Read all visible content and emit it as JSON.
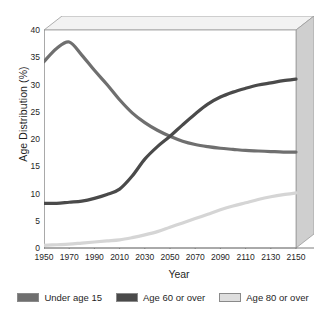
{
  "chart_data": {
    "type": "line",
    "title": "",
    "xlabel": "Year",
    "ylabel": "Age Distribution (%)",
    "xlim": [
      1950,
      2150
    ],
    "ylim": [
      0,
      40
    ],
    "grid": false,
    "legend_position": "bottom",
    "x_ticks": [
      "1950",
      "1970",
      "1990",
      "2010",
      "2030",
      "2050",
      "2070",
      "2090",
      "2110",
      "2130",
      "2150"
    ],
    "y_ticks": [
      "0",
      "5",
      "10",
      "15",
      "20",
      "25",
      "30",
      "35",
      "40"
    ],
    "x": [
      1950,
      1960,
      1970,
      1980,
      1990,
      2000,
      2010,
      2020,
      2030,
      2040,
      2050,
      2060,
      2070,
      2080,
      2090,
      2100,
      2110,
      2120,
      2130,
      2140,
      2150
    ],
    "series": [
      {
        "name": "Under age 15",
        "color": "#6f6f6f",
        "values": [
          34.2,
          36.6,
          37.8,
          35.4,
          32.6,
          30.0,
          27.2,
          24.8,
          23.0,
          21.6,
          20.5,
          19.6,
          19.0,
          18.6,
          18.3,
          18.1,
          17.9,
          17.8,
          17.7,
          17.6,
          17.6
        ]
      },
      {
        "name": "Age 60 or over",
        "color": "#4a4a4a",
        "values": [
          8.2,
          8.2,
          8.4,
          8.6,
          9.1,
          9.8,
          10.8,
          13.2,
          16.3,
          18.6,
          20.5,
          22.6,
          24.6,
          26.4,
          27.7,
          28.6,
          29.3,
          29.9,
          30.3,
          30.7,
          31.0
        ]
      },
      {
        "name": "Age 80 or over",
        "color": "#d5d5d5",
        "values": [
          0.5,
          0.6,
          0.7,
          0.9,
          1.1,
          1.3,
          1.5,
          1.9,
          2.4,
          3.0,
          3.8,
          4.6,
          5.4,
          6.2,
          7.0,
          7.7,
          8.3,
          8.9,
          9.4,
          9.8,
          10.1
        ]
      }
    ]
  },
  "legend": {
    "items": [
      {
        "label": "Under age 15",
        "color": "#6f6f6f"
      },
      {
        "label": "Age 60 or over",
        "color": "#4a4a4a"
      },
      {
        "label": "Age 80 or over",
        "color": "#dedede"
      }
    ]
  }
}
